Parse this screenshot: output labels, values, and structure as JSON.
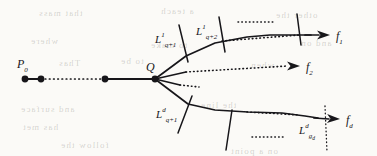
{
  "figure": {
    "kind": "mathematical-diagram",
    "width": 377,
    "height": 156,
    "background_color": "#fbfaf7",
    "ink_color": "#17161a"
  },
  "vertex_labels": {
    "start": {
      "base": "P",
      "sub": "0"
    },
    "branch": {
      "base": "Q",
      "sub": ""
    }
  },
  "branch_end_labels": [
    {
      "id": "f1",
      "base": "f",
      "sub": "1"
    },
    {
      "id": "f2",
      "base": "f",
      "sub": "2"
    },
    {
      "id": "fd",
      "base": "f",
      "sub": "d"
    }
  ],
  "transversal_labels": [
    {
      "id": "L-top-1",
      "base": "L",
      "sup": "1",
      "sub": "q+1"
    },
    {
      "id": "L-top-2",
      "base": "L",
      "sup": "1",
      "sub": "q+2"
    },
    {
      "id": "L-bot-1",
      "base": "L",
      "sup": "d",
      "sub": "q+1"
    },
    {
      "id": "L-bot-last",
      "base": "L",
      "sup": "d",
      "sub": "g",
      "subsub": "d"
    }
  ],
  "nodes": [
    {
      "id": "p0",
      "x": 25,
      "y": 79,
      "r": 3.4
    },
    {
      "id": "p1",
      "x": 41,
      "y": 79,
      "r": 3.4
    },
    {
      "id": "p2",
      "x": 105,
      "y": 79,
      "r": 3.4
    },
    {
      "id": "q",
      "x": 155,
      "y": 79,
      "r": 3.4
    }
  ],
  "solid_segments": [
    {
      "id": "seg-p0-p1",
      "points": "25,79 41,79"
    },
    {
      "id": "seg-p2-q",
      "points": "105,79 155,79"
    }
  ],
  "dotted_segments": [
    {
      "id": "seg-p1-p2",
      "points": "41,79 105,79"
    }
  ],
  "branch_paths": {
    "top": {
      "id": "branch-f1",
      "solid": "155,79 186,56 215,43 247,37 270,35 296,35 311,35",
      "arrow_tip": {
        "x": 330,
        "y": 35
      },
      "arrow_from": {
        "x": 305,
        "y": 35
      },
      "dotted_overlay": "222,41 300,35"
    },
    "middle": {
      "id": "branch-f2",
      "solid": "155,79 186,72",
      "dotted": "186,72 288,66",
      "arrow_tip": {
        "x": 300,
        "y": 66
      },
      "arrow_from": {
        "x": 276,
        "y": 66
      }
    },
    "stub": {
      "id": "branch-stub",
      "solid": "155,79 180,85",
      "dotted": "180,85 199,87"
    },
    "bottom": {
      "id": "branch-fd",
      "solid": "155,79 188,104 215,110 248,112 282,113 305,116 318,118",
      "arrow_tip": {
        "x": 340,
        "y": 119
      },
      "arrow_from": {
        "x": 314,
        "y": 118
      },
      "dotted_overlay": "247,112 300,115"
    }
  },
  "transversal_segments": [
    {
      "id": "tv-top-1",
      "points": "179,25 188,62",
      "style": "solid"
    },
    {
      "id": "tv-top-2",
      "points": "219,17 225,52",
      "style": "solid"
    },
    {
      "id": "tv-top-3",
      "points": "297,14 301,45",
      "style": "solid"
    },
    {
      "id": "tv-bot-1",
      "points": "178,133 192,96",
      "style": "solid"
    },
    {
      "id": "tv-bot-2",
      "points": "226,150 232,110",
      "style": "solid"
    },
    {
      "id": "tv-bot-last",
      "points": "325,106 327,152",
      "style": "dotted"
    }
  ],
  "ellipsis_marks": [
    {
      "id": "dots-top",
      "points": "238,22 274,22"
    },
    {
      "id": "dots-bottom",
      "points": "252,137 284,137"
    }
  ],
  "showthrough_text": [
    {
      "text": "that mass",
      "x": 38,
      "y": 8,
      "size": 9
    },
    {
      "text": "a teach",
      "x": 160,
      "y": 6,
      "size": 9
    },
    {
      "text": "other the",
      "x": 275,
      "y": 10,
      "size": 9
    },
    {
      "text": "where",
      "x": 30,
      "y": 36,
      "size": 9
    },
    {
      "text": "to make",
      "x": 150,
      "y": 40,
      "size": 9
    },
    {
      "text": "and on",
      "x": 300,
      "y": 38,
      "size": 9
    },
    {
      "text": "Thas",
      "x": 58,
      "y": 58,
      "size": 9
    },
    {
      "text": "to be",
      "x": 120,
      "y": 56,
      "size": 9
    },
    {
      "text": "when",
      "x": 250,
      "y": 60,
      "size": 9
    },
    {
      "text": "and surface",
      "x": 20,
      "y": 104,
      "size": 9
    },
    {
      "text": "the line",
      "x": 200,
      "y": 100,
      "size": 9
    },
    {
      "text": "has met",
      "x": 22,
      "y": 122,
      "size": 9
    },
    {
      "text": "follow the",
      "x": 60,
      "y": 140,
      "size": 9
    },
    {
      "text": "on a point",
      "x": 230,
      "y": 146,
      "size": 9
    }
  ]
}
